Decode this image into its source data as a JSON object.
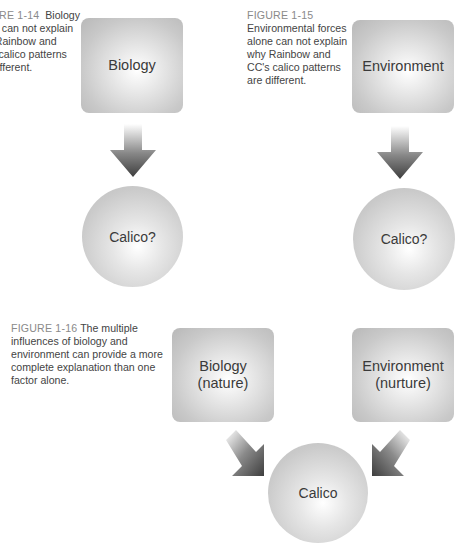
{
  "figures": [
    {
      "id": "fig-1-14",
      "caption_label": "FIGURE 1-14",
      "caption_text": "Biology alone can not explain why Rainbow and CC's calico patterns are different.",
      "caption_lines": [
        "FIGURE 1-14  Biology",
        "alone can not explain",
        "why Rainbow and",
        "CC's calico patterns",
        "are different."
      ],
      "box_label": "Biology",
      "circle_label": "Calico?"
    },
    {
      "id": "fig-1-15",
      "caption_label": "FIGURE 1-15",
      "caption_lines": [
        "Environmental forces",
        "alone can not explain",
        "why Rainbow and",
        "CC's calico patterns",
        "are different."
      ],
      "box_label": "Environment",
      "circle_label": "Calico?"
    },
    {
      "id": "fig-1-16",
      "caption_label": "FIGURE 1-16",
      "caption_lines": [
        "The multiple",
        "influences of biology and",
        "environment can provide a more",
        "complete explanation than one",
        "factor alone."
      ],
      "box_left_line1": "Biology",
      "box_left_line2": "(nature)",
      "box_right_line1": "Environment",
      "box_right_line2": "(nurture)",
      "circle_label": "Calico"
    }
  ],
  "colors": {
    "caption_label": "#8a8a8a",
    "caption_text": "#444444",
    "shape_text": "#3a3a3a",
    "arrow_dark": "#4a4a4a"
  }
}
